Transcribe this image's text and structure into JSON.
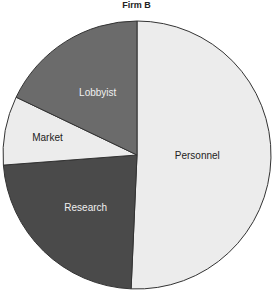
{
  "chart_data": {
    "type": "pie",
    "title": "Firm B",
    "categories": [
      "Personnel",
      "Research",
      "Market",
      "Lobbyist"
    ],
    "values": [
      50.7,
      23.1,
      8.3,
      17.9
    ],
    "unit": "percent (estimated)",
    "colors": [
      "#ececec",
      "#4a4a4a",
      "#ececec",
      "#6b6b6b"
    ],
    "label_colors": [
      "#222222",
      "#f0f0f0",
      "#222222",
      "#f0f0f0"
    ],
    "start_angle_deg": 0,
    "direction": "clockwise",
    "legend": "none (labels inside slices)"
  }
}
